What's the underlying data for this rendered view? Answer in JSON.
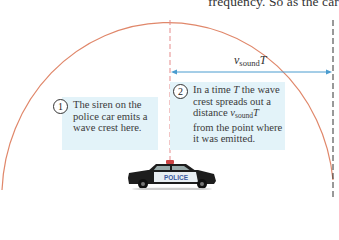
{
  "header": {
    "partial_text": "frequency. So as the car"
  },
  "diagram": {
    "distance_label": {
      "symbol": "v",
      "subscript": "sound",
      "suffix": "T"
    },
    "callouts": [
      {
        "number": "1",
        "lines": [
          "The siren on the",
          "police car emits a",
          "wave crest here."
        ]
      },
      {
        "number": "2",
        "lines": [
          "In a time T the wave",
          "crest spreads out a",
          "distance v",
          "from the point where",
          "it was emitted."
        ],
        "line3_subscript": "sound",
        "line3_suffix": "T",
        "line1_prefix": "In a time ",
        "line1_italic": "T",
        "line1_suffix": " the wave"
      }
    ],
    "car_label": "POLICE",
    "colors": {
      "wave_crest": "#e0876a",
      "emission_line": "#e58b8b",
      "distance_arrow": "#4a9ccf",
      "callout_bg": "#e3f3f9",
      "wavefront_line": "#333333"
    }
  }
}
